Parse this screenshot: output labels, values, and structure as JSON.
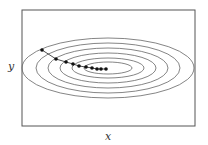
{
  "figure": {
    "xlabel": "x",
    "ylabel": "y",
    "frame": {
      "x": 22,
      "y": 10,
      "w": 173,
      "h": 116
    },
    "ellipses": {
      "cx": 108,
      "cy": 68,
      "radii": [
        [
          86,
          30
        ],
        [
          72,
          25
        ],
        [
          60,
          20
        ],
        [
          48,
          15
        ],
        [
          36,
          10
        ],
        [
          24,
          6
        ]
      ],
      "color": "#666666"
    },
    "path_points": [
      [
        42,
        50
      ],
      [
        56,
        59
      ],
      [
        66,
        62
      ],
      [
        73,
        64
      ],
      [
        79,
        66
      ],
      [
        86,
        67
      ],
      [
        92,
        68
      ],
      [
        97,
        69
      ],
      [
        101,
        69
      ],
      [
        106,
        69
      ]
    ],
    "point_color": "#111111"
  }
}
